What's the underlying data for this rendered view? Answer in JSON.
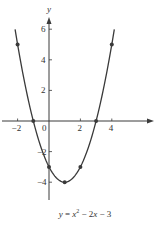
{
  "chart_data": {
    "type": "line",
    "title": "",
    "caption": "y = x² − 2x − 3",
    "caption_parts": {
      "lhs": "y",
      "eq": " = ",
      "x1": "x",
      "sup": "2",
      "rest1": " − 2",
      "x2": "x",
      "rest2": " − 3"
    },
    "function": "x^2 - 2x - 3",
    "xlabel": "",
    "ylabel": "y",
    "xlim": [
      -3.1,
      6.7
    ],
    "ylim": [
      -5.2,
      6.8
    ],
    "x_ticks": [
      -2,
      0,
      2,
      4
    ],
    "x_tick_labels": [
      "−2",
      "0",
      "2",
      "4"
    ],
    "y_ticks": [
      -4,
      -2,
      2,
      4,
      6
    ],
    "y_tick_labels": [
      "−4",
      "−2",
      "2",
      "4",
      "6"
    ],
    "grid": false,
    "series": [
      {
        "name": "y = x^2 - 2x - 3",
        "curve_x_range": [
          -2.16,
          4.16
        ],
        "marked_points": [
          {
            "x": -2,
            "y": 5
          },
          {
            "x": -1,
            "y": 0
          },
          {
            "x": 0,
            "y": -3
          },
          {
            "x": 1,
            "y": -4
          },
          {
            "x": 2,
            "y": -3
          },
          {
            "x": 3,
            "y": 0
          },
          {
            "x": 4,
            "y": 5
          }
        ]
      }
    ],
    "colors": {
      "curve": "#3a3a3a",
      "axis": "#3a3a3a",
      "point": "#3a3a3a"
    }
  }
}
